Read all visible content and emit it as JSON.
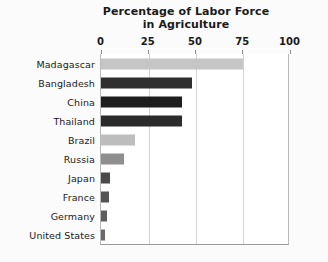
{
  "chart_data": {
    "type": "bar",
    "orientation": "horizontal",
    "title": "Percentage of Labor Force in Agriculture",
    "title_line1": "Percentage of Labor Force",
    "title_line2": "in Agriculture",
    "xlabel": "",
    "ylabel": "",
    "xlim": [
      0,
      100
    ],
    "xticks": [
      0,
      25,
      50,
      75,
      100
    ],
    "xtick_labels": [
      "0",
      "25",
      "50",
      "75",
      "100"
    ],
    "grid": true,
    "grid_axis": "x",
    "legend": false,
    "categories": [
      "Madagascar",
      "Bangladesh",
      "China",
      "Thailand",
      "Brazil",
      "Russia",
      "Japan",
      "France",
      "Germany",
      "United States"
    ],
    "values": [
      75,
      48,
      43,
      43,
      18,
      12,
      5,
      4,
      3,
      2
    ],
    "bar_colors": [
      "#c6c6c6",
      "#2f2f2f",
      "#1e1e1e",
      "#2b2b2b",
      "#bdbdbd",
      "#8f8f8f",
      "#4a4a4a",
      "#545454",
      "#5d5d5d",
      "#6b6b6b"
    ],
    "bars": [
      {
        "label": "Madagascar",
        "value": 75,
        "color": "#c6c6c6"
      },
      {
        "label": "Bangladesh",
        "value": 48,
        "color": "#2f2f2f"
      },
      {
        "label": "China",
        "value": 43,
        "color": "#1e1e1e"
      },
      {
        "label": "Thailand",
        "value": 43,
        "color": "#2b2b2b"
      },
      {
        "label": "Brazil",
        "value": 18,
        "color": "#bdbdbd"
      },
      {
        "label": "Russia",
        "value": 12,
        "color": "#8f8f8f"
      },
      {
        "label": "Japan",
        "value": 5,
        "color": "#4a4a4a"
      },
      {
        "label": "France",
        "value": 4,
        "color": "#545454"
      },
      {
        "label": "Germany",
        "value": 3,
        "color": "#5d5d5d"
      },
      {
        "label": "United States",
        "value": 2,
        "color": "#6b6b6b"
      }
    ]
  },
  "colors": {
    "background": "#fbfbfb",
    "plot_background": "#ffffff",
    "gridline": "#d2d2d2",
    "axis": "#9a9a9a",
    "text": "#1a1a1a"
  }
}
